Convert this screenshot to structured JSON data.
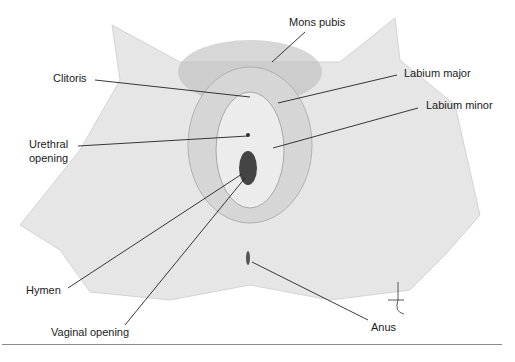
{
  "figure": {
    "type": "anatomical-diagram",
    "colors": {
      "skin": "#e6e6e6",
      "shade": "#cfcfcf",
      "line": "#222222",
      "hair": "#6e6e6e",
      "rule": "#8a8a8a"
    },
    "labels": {
      "mons_pubis": "Mons pubis",
      "clitoris": "Clitoris",
      "labium_major": "Labium major",
      "labium_minor": "Labium minor",
      "urethral_opening_1": "Urethral",
      "urethral_opening_2": "opening",
      "hymen": "Hymen",
      "vaginal_opening": "Vaginal opening",
      "anus": "Anus"
    },
    "signature": "Lina"
  }
}
